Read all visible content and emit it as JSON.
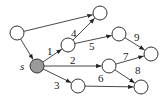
{
  "diagram": {
    "type": "directed-graph",
    "source_label": "s",
    "colors": {
      "source_fill": "#9a9a9a",
      "node_fill": "#ffffff",
      "stroke": "#333333"
    },
    "nodes": [
      {
        "id": "top_left",
        "x": 17,
        "y": 33
      },
      {
        "id": "top",
        "x": 100,
        "y": 13
      },
      {
        "id": "s",
        "x": 37,
        "y": 66,
        "source": true,
        "label": "s"
      },
      {
        "id": "n1",
        "x": 68,
        "y": 45
      },
      {
        "id": "n5",
        "x": 119,
        "y": 34
      },
      {
        "id": "n9",
        "x": 151,
        "y": 54
      },
      {
        "id": "n2",
        "x": 109,
        "y": 66
      },
      {
        "id": "n8",
        "x": 141,
        "y": 87
      },
      {
        "id": "n3",
        "x": 78,
        "y": 86
      }
    ],
    "edges": [
      {
        "from": "top_left",
        "to": "top",
        "label": ""
      },
      {
        "from": "top_left",
        "to": "s",
        "label": ""
      },
      {
        "from": "s",
        "to": "n1",
        "label": "1",
        "lx": 47,
        "ly": 55
      },
      {
        "from": "n1",
        "to": "top",
        "label": "4",
        "lx": 71,
        "ly": 37
      },
      {
        "from": "n1",
        "to": "n5",
        "label": "5",
        "lx": 89,
        "ly": 50
      },
      {
        "from": "n5",
        "to": "n9",
        "label": "9",
        "lx": 134,
        "ly": 41
      },
      {
        "from": "s",
        "to": "n2",
        "label": "2",
        "lx": 70,
        "ly": 64
      },
      {
        "from": "n2",
        "to": "n9",
        "label": "7",
        "lx": 123,
        "ly": 60
      },
      {
        "from": "n2",
        "to": "n8",
        "label": "8",
        "lx": 135,
        "ly": 74
      },
      {
        "from": "s",
        "to": "n3",
        "label": "3",
        "lx": 54,
        "ly": 89
      },
      {
        "from": "n3",
        "to": "n8",
        "label": "6",
        "lx": 98,
        "ly": 82
      }
    ]
  }
}
